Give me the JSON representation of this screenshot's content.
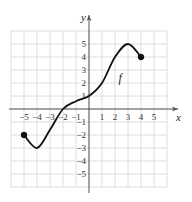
{
  "chart_data": {
    "type": "line",
    "title": "",
    "xlabel": "x",
    "ylabel": "y",
    "xlim": [
      -6,
      6
    ],
    "ylim": [
      -6,
      6
    ],
    "grid": true,
    "x_ticks": [
      -5,
      -4,
      -3,
      -2,
      -1,
      1,
      2,
      3,
      4,
      5
    ],
    "y_ticks": [
      5,
      4,
      3,
      2,
      1,
      -1,
      -2,
      -3,
      -4,
      -5
    ],
    "x_tick_labels": [
      "−5",
      "−4",
      "−3",
      "−2",
      "−1",
      "1",
      "2",
      "3",
      "4",
      "5"
    ],
    "y_tick_labels": [
      "5",
      "4",
      "3",
      "2",
      "1",
      "−1",
      "−2",
      "−3",
      "−4",
      "−5"
    ],
    "series": [
      {
        "name": "f",
        "points": [
          {
            "x": -5,
            "y": -2
          },
          {
            "x": -4,
            "y": -3
          },
          {
            "x": -3,
            "y": -1.6
          },
          {
            "x": -2,
            "y": 0
          },
          {
            "x": -1,
            "y": 0.6
          },
          {
            "x": 0,
            "y": 1
          },
          {
            "x": 1,
            "y": 2
          },
          {
            "x": 2,
            "y": 4
          },
          {
            "x": 3,
            "y": 5
          },
          {
            "x": 4,
            "y": 4
          }
        ],
        "endpoints": [
          {
            "x": -5,
            "y": -2,
            "closed": true
          },
          {
            "x": 4,
            "y": 4,
            "closed": true
          }
        ]
      }
    ],
    "annotations": [
      {
        "text": "f",
        "x": 2.5,
        "y": 2.4
      }
    ],
    "legend": "none"
  },
  "labels": {
    "x_axis": "x",
    "y_axis": "y",
    "function_name": "f"
  }
}
